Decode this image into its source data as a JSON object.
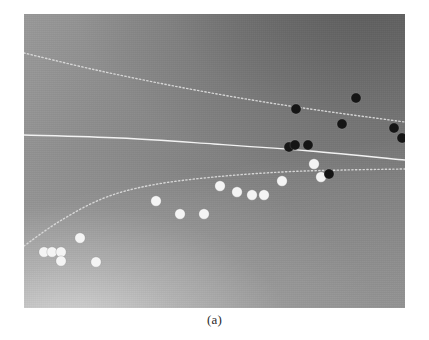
{
  "figure": {
    "caption": "(a)",
    "panel": {
      "x": 24,
      "y": 14,
      "width": 381,
      "height": 294
    },
    "colors": {
      "class_positive_marker": "#f4f4f4",
      "class_negative_marker": "#151515",
      "decision_boundary": "#f2f2f2",
      "margin_curve": "#dcdcdc",
      "background_dark": "#787878",
      "background_light": "#d7d7d7",
      "page_background": "#ffffff"
    }
  },
  "chart_data": {
    "type": "scatter",
    "title": "",
    "xlabel": "",
    "ylabel": "",
    "grid": false,
    "legend": "none",
    "xlim": [
      0,
      381
    ],
    "ylim": [
      0,
      294
    ],
    "note": "Grayscale decision-surface figure: shaded background field, one solid decision boundary and two dotted level/margin curves, with two classes of circular markers (white and black).",
    "series": [
      {
        "name": "class-white",
        "marker": "filled-circle",
        "color": "#f4f4f4",
        "radius": 5.2,
        "points": [
          [
            20,
            238
          ],
          [
            28,
            238
          ],
          [
            37,
            238
          ],
          [
            37,
            247
          ],
          [
            56,
            224
          ],
          [
            72,
            248
          ],
          [
            132,
            187
          ],
          [
            156,
            200
          ],
          [
            180,
            200
          ],
          [
            196,
            172
          ],
          [
            213,
            178
          ],
          [
            228,
            181
          ],
          [
            240,
            181
          ],
          [
            258,
            167
          ],
          [
            290,
            150
          ],
          [
            297,
            163
          ]
        ]
      },
      {
        "name": "class-black",
        "marker": "filled-circle",
        "color": "#151515",
        "radius": 5.0,
        "points": [
          [
            272,
            95
          ],
          [
            318,
            110
          ],
          [
            332,
            84
          ],
          [
            370,
            114
          ],
          [
            378,
            124
          ],
          [
            265,
            133
          ],
          [
            271,
            131
          ],
          [
            284,
            131
          ],
          [
            305,
            160
          ]
        ]
      }
    ],
    "curves": [
      {
        "name": "decision-boundary",
        "style": "solid",
        "color": "#f2f2f2",
        "width": 1.4,
        "path": [
          [
            0,
            121
          ],
          [
            96,
            124
          ],
          [
            190,
            130
          ],
          [
            286,
            137
          ],
          [
            381,
            146
          ]
        ]
      },
      {
        "name": "upper-margin-curve",
        "style": "dotted",
        "color": "#dcdcdc",
        "width": 1.4,
        "path": [
          [
            0,
            39
          ],
          [
            72,
            56
          ],
          [
            150,
            72
          ],
          [
            228,
            86
          ],
          [
            300,
            97
          ],
          [
            381,
            108
          ]
        ]
      },
      {
        "name": "lower-margin-curve",
        "style": "dotted",
        "color": "#dcdcdc",
        "width": 1.4,
        "path": [
          [
            0,
            232
          ],
          [
            36,
            207
          ],
          [
            80,
            184
          ],
          [
            128,
            171
          ],
          [
            190,
            163
          ],
          [
            258,
            158
          ],
          [
            320,
            156
          ],
          [
            381,
            155
          ]
        ]
      }
    ]
  }
}
